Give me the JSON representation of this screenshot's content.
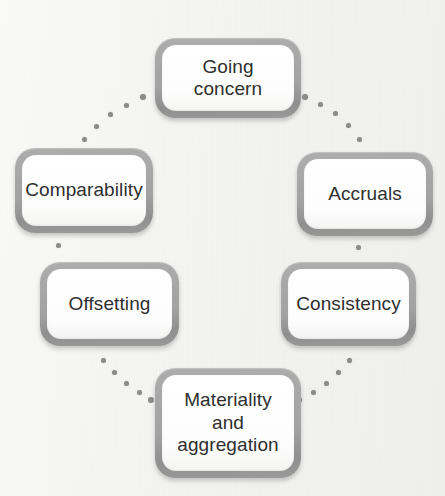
{
  "diagram": {
    "type": "cycle",
    "node_count": 6,
    "connector_style": "dotted-arc",
    "colors": {
      "background": "#f4f4f2",
      "node_border": "#a2a2a2",
      "node_fill": "#ffffff",
      "node_text": "#2f2f2f",
      "connector_dot": "#8c8c8c"
    },
    "nodes": [
      {
        "id": "going-concern",
        "label": "Going concern",
        "position": "top"
      },
      {
        "id": "comparability",
        "label": "Comparability",
        "position": "upper-left"
      },
      {
        "id": "accruals",
        "label": "Accruals",
        "position": "upper-right"
      },
      {
        "id": "offsetting",
        "label": "Offsetting",
        "position": "lower-left"
      },
      {
        "id": "consistency",
        "label": "Consistency",
        "position": "lower-right"
      },
      {
        "id": "materiality",
        "label": "Materiality\nand\naggregation",
        "position": "bottom"
      }
    ],
    "connectors": [
      {
        "from": "comparability",
        "to": "going-concern",
        "style": "dotted-arc"
      },
      {
        "from": "going-concern",
        "to": "accruals",
        "style": "dotted-arc"
      },
      {
        "from": "accruals",
        "to": "consistency",
        "style": "dotted-arc"
      },
      {
        "from": "consistency",
        "to": "materiality",
        "style": "dotted-arc"
      },
      {
        "from": "materiality",
        "to": "offsetting",
        "style": "dotted-arc"
      },
      {
        "from": "offsetting",
        "to": "comparability",
        "style": "dotted-arc"
      }
    ],
    "connector_dots": [
      {
        "x": 84,
        "y": 139,
        "size": 5
      },
      {
        "x": 96,
        "y": 126,
        "size": 5
      },
      {
        "x": 110,
        "y": 114,
        "size": 5
      },
      {
        "x": 126,
        "y": 105,
        "size": 5
      },
      {
        "x": 143,
        "y": 97,
        "size": 6
      },
      {
        "x": 305,
        "y": 97,
        "size": 6
      },
      {
        "x": 320,
        "y": 104,
        "size": 5
      },
      {
        "x": 335,
        "y": 113,
        "size": 5
      },
      {
        "x": 348,
        "y": 125,
        "size": 5
      },
      {
        "x": 359,
        "y": 139,
        "size": 5
      },
      {
        "x": 358,
        "y": 247,
        "size": 5
      },
      {
        "x": 58,
        "y": 245,
        "size": 5
      },
      {
        "x": 103,
        "y": 360,
        "size": 5
      },
      {
        "x": 114,
        "y": 372,
        "size": 5
      },
      {
        "x": 126,
        "y": 383,
        "size": 5
      },
      {
        "x": 139,
        "y": 392,
        "size": 5
      },
      {
        "x": 151,
        "y": 400,
        "size": 6
      },
      {
        "x": 299,
        "y": 400,
        "size": 6
      },
      {
        "x": 313,
        "y": 392,
        "size": 5
      },
      {
        "x": 326,
        "y": 383,
        "size": 5
      },
      {
        "x": 338,
        "y": 372,
        "size": 5
      },
      {
        "x": 349,
        "y": 360,
        "size": 5
      }
    ]
  }
}
